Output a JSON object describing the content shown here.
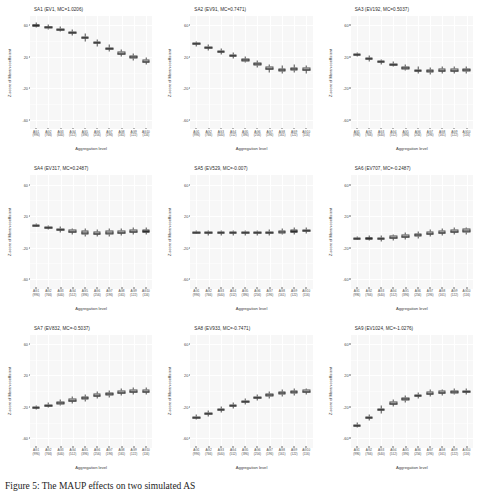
{
  "figure": {
    "caption": "Figure 5: The MAUP effects on two simulated AS",
    "axis_labels": {
      "x": "Aggregation level",
      "y": "Z-score of Moran coefficient"
    },
    "y_ticks": [
      "60",
      "20",
      "-20",
      "-60"
    ],
    "y_tick_values": [
      60,
      20,
      -20,
      -60
    ],
    "ylim": [
      -72,
      72
    ],
    "x_tick_labels": [
      {
        "line1": "AG1",
        "line2": "(996)"
      },
      {
        "line1": "AG2",
        "line2": "(766)"
      },
      {
        "line1": "AG3",
        "line2": "(640)"
      },
      {
        "line1": "AG4",
        "line2": "(512)"
      },
      {
        "line1": "AG5",
        "line2": "(396)"
      },
      {
        "line1": "AG6",
        "line2": "(256)"
      },
      {
        "line1": "AG7",
        "line2": "(196)"
      },
      {
        "line1": "AG8",
        "line2": "(161)"
      },
      {
        "line1": "AG9",
        "line2": "(122)"
      },
      {
        "line1": "AG10",
        "line2": "(116)"
      }
    ]
  },
  "chart_data": [
    {
      "type": "boxplot",
      "title": "SA1 (EV1, MC=1.0206)",
      "xlabel": "Aggregation level",
      "ylabel": "Z-score of Moran coefficient",
      "ylim": [
        -72,
        72
      ],
      "grid": true,
      "categories": [
        "AG1 (996)",
        "AG2 (766)",
        "AG3 (640)",
        "AG4 (512)",
        "AG5 (396)",
        "AG6 (256)",
        "AG7 (196)",
        "AG8 (161)",
        "AG9 (122)",
        "AG10 (116)"
      ],
      "medians": [
        60.0,
        57.5,
        54.5,
        50.0,
        44.0,
        37.5,
        30.0,
        24.0,
        19.5,
        14.0
      ],
      "q1": [
        59.0,
        56.5,
        53.2,
        48.6,
        42.4,
        35.8,
        28.2,
        22.2,
        17.6,
        12.2
      ],
      "q3": [
        61.0,
        58.5,
        55.8,
        51.4,
        45.6,
        39.2,
        31.8,
        25.8,
        21.4,
        15.8
      ],
      "whisker_low": [
        57.0,
        54.5,
        51.0,
        46.0,
        39.5,
        33.0,
        25.5,
        19.5,
        15.0,
        9.5
      ],
      "whisker_high": [
        63.0,
        60.5,
        58.0,
        54.0,
        48.5,
        42.0,
        34.5,
        28.5,
        24.0,
        18.5
      ]
    },
    {
      "type": "boxplot",
      "title": "SA2 (EV91, MC=0.7471)",
      "xlabel": "Aggregation level",
      "ylabel": "Z-score of Moran coefficient",
      "ylim": [
        -72,
        72
      ],
      "grid": true,
      "categories": [
        "AG1 (996)",
        "AG2 (766)",
        "AG3 (640)",
        "AG4 (512)",
        "AG5 (396)",
        "AG6 (256)",
        "AG7 (196)",
        "AG8 (161)",
        "AG9 (122)",
        "AG10 (116)"
      ],
      "medians": [
        36.0,
        31.0,
        26.0,
        21.0,
        15.5,
        10.5,
        5.0,
        3.0,
        4.0,
        3.5
      ],
      "q1": [
        34.8,
        29.8,
        24.8,
        19.6,
        14.0,
        8.8,
        3.0,
        1.0,
        2.0,
        1.5
      ],
      "q3": [
        37.2,
        32.2,
        27.2,
        22.4,
        17.0,
        12.2,
        7.0,
        5.0,
        6.0,
        5.5
      ],
      "whisker_low": [
        32.5,
        27.5,
        22.5,
        17.0,
        11.5,
        6.0,
        0.0,
        -2.0,
        -1.0,
        -1.5
      ],
      "whisker_high": [
        39.5,
        34.5,
        29.5,
        25.0,
        19.5,
        15.0,
        10.0,
        8.0,
        9.0,
        8.5
      ]
    },
    {
      "type": "boxplot",
      "title": "SA3 (EV192, MC=0.5037)",
      "xlabel": "Aggregation level",
      "ylabel": "Z-score of Moran coefficient",
      "ylim": [
        -72,
        72
      ],
      "grid": true,
      "categories": [
        "AG1 (996)",
        "AG2 (766)",
        "AG3 (640)",
        "AG4 (512)",
        "AG5 (396)",
        "AG6 (256)",
        "AG7 (196)",
        "AG8 (161)",
        "AG9 (122)",
        "AG10 (116)"
      ],
      "medians": [
        22.0,
        17.0,
        13.0,
        10.0,
        5.5,
        2.0,
        1.5,
        2.0,
        2.5,
        3.0
      ],
      "q1": [
        21.0,
        15.8,
        11.6,
        8.6,
        3.8,
        0.2,
        -0.5,
        0.0,
        0.5,
        1.0
      ],
      "q3": [
        23.0,
        18.2,
        14.4,
        11.4,
        7.2,
        3.8,
        3.5,
        4.0,
        4.5,
        5.0
      ],
      "whisker_low": [
        19.5,
        13.5,
        9.5,
        6.5,
        1.5,
        -2.5,
        -3.0,
        -2.5,
        -2.0,
        -1.5
      ],
      "whisker_high": [
        24.5,
        20.5,
        16.5,
        13.5,
        9.5,
        6.5,
        6.0,
        6.5,
        7.0,
        7.5
      ]
    },
    {
      "type": "boxplot",
      "title": "SA4 (EV317, MC=0.2487)",
      "xlabel": "Aggregation level",
      "ylabel": "Z-score of Moran coefficient",
      "ylim": [
        -72,
        72
      ],
      "grid": true,
      "categories": [
        "AG1 (996)",
        "AG2 (766)",
        "AG3 (640)",
        "AG4 (512)",
        "AG5 (396)",
        "AG6 (256)",
        "AG7 (196)",
        "AG8 (161)",
        "AG9 (122)",
        "AG10 (116)"
      ],
      "medians": [
        8.0,
        5.0,
        2.5,
        0.0,
        -1.5,
        -2.5,
        -1.5,
        -1.0,
        0.0,
        0.5
      ],
      "q1": [
        7.2,
        3.8,
        1.0,
        -1.8,
        -3.5,
        -4.5,
        -3.5,
        -3.0,
        -2.0,
        -1.5
      ],
      "q3": [
        8.8,
        6.2,
        4.0,
        1.8,
        0.5,
        -0.5,
        0.5,
        1.0,
        2.0,
        2.5
      ],
      "whisker_low": [
        6.0,
        2.0,
        -1.0,
        -4.0,
        -6.0,
        -7.0,
        -6.0,
        -5.5,
        -4.5,
        -4.0
      ],
      "whisker_high": [
        10.0,
        8.0,
        6.0,
        4.0,
        3.0,
        2.0,
        3.0,
        3.5,
        4.5,
        5.0
      ]
    },
    {
      "type": "boxplot",
      "title": "SA5 (EV529, MC=-0.007)",
      "xlabel": "Aggregation level",
      "ylabel": "Z-score of Moran coefficient",
      "ylim": [
        -72,
        72
      ],
      "grid": true,
      "categories": [
        "AG1 (996)",
        "AG2 (766)",
        "AG3 (640)",
        "AG4 (512)",
        "AG5 (396)",
        "AG6 (256)",
        "AG7 (196)",
        "AG8 (161)",
        "AG9 (122)",
        "AG10 (116)"
      ],
      "medians": [
        -1.0,
        -2.0,
        -2.0,
        -2.0,
        -2.0,
        -2.0,
        -1.5,
        -0.5,
        0.5,
        1.0
      ],
      "q1": [
        -1.6,
        -3.4,
        -3.4,
        -3.4,
        -3.4,
        -3.4,
        -3.2,
        -2.2,
        -1.2,
        -0.8
      ],
      "q3": [
        -0.4,
        -0.6,
        -0.6,
        -0.6,
        -0.6,
        -0.6,
        0.2,
        1.2,
        2.2,
        2.8
      ],
      "whisker_low": [
        -2.5,
        -5.5,
        -5.5,
        -5.5,
        -5.5,
        -5.5,
        -5.5,
        -4.5,
        -3.5,
        -3.0
      ],
      "whisker_high": [
        0.5,
        1.5,
        1.5,
        1.5,
        1.5,
        1.5,
        2.5,
        3.5,
        4.5,
        5.0
      ]
    },
    {
      "type": "boxplot",
      "title": "SA6 (EV707, MC=-0.2487)",
      "xlabel": "Aggregation level",
      "ylabel": "Z-score of Moran coefficient",
      "ylim": [
        -72,
        72
      ],
      "grid": true,
      "categories": [
        "AG1 (996)",
        "AG2 (766)",
        "AG3 (640)",
        "AG4 (512)",
        "AG5 (396)",
        "AG6 (256)",
        "AG7 (196)",
        "AG8 (161)",
        "AG9 (122)",
        "AG10 (116)"
      ],
      "medians": [
        -9.0,
        -8.5,
        -9.0,
        -7.5,
        -6.0,
        -4.5,
        -2.5,
        -1.0,
        0.0,
        1.0
      ],
      "q1": [
        -9.8,
        -9.6,
        -10.2,
        -9.2,
        -8.0,
        -6.5,
        -4.5,
        -3.0,
        -2.0,
        -1.0
      ],
      "q3": [
        -8.2,
        -7.4,
        -7.8,
        -5.8,
        -4.0,
        -2.5,
        -0.5,
        1.0,
        2.0,
        3.0
      ],
      "whisker_low": [
        -11.0,
        -11.5,
        -12.5,
        -11.5,
        -10.5,
        -9.0,
        -7.0,
        -5.5,
        -4.5,
        -3.5
      ],
      "whisker_high": [
        -7.0,
        -5.5,
        -5.5,
        -3.5,
        -1.5,
        0.0,
        2.0,
        3.5,
        4.5,
        5.5
      ]
    },
    {
      "type": "boxplot",
      "title": "SA7 (EV832, MC=-0.5037)",
      "xlabel": "Aggregation level",
      "ylabel": "Z-score of Moran coefficient",
      "ylim": [
        -72,
        72
      ],
      "grid": true,
      "categories": [
        "AG1 (996)",
        "AG2 (766)",
        "AG3 (640)",
        "AG4 (512)",
        "AG5 (396)",
        "AG6 (256)",
        "AG7 (196)",
        "AG8 (161)",
        "AG9 (122)",
        "AG10 (116)"
      ],
      "medians": [
        -21.0,
        -18.5,
        -15.5,
        -12.5,
        -9.0,
        -6.0,
        -4.0,
        -2.0,
        -1.0,
        -0.5
      ],
      "q1": [
        -22.0,
        -20.0,
        -17.2,
        -14.4,
        -11.0,
        -8.0,
        -6.0,
        -4.0,
        -3.0,
        -2.5
      ],
      "q3": [
        -20.0,
        -17.0,
        -13.8,
        -10.6,
        -7.0,
        -4.0,
        -2.0,
        0.0,
        1.0,
        1.5
      ],
      "whisker_low": [
        -23.5,
        -22.0,
        -19.5,
        -17.0,
        -13.5,
        -10.5,
        -8.5,
        -6.5,
        -5.5,
        -5.0
      ],
      "whisker_high": [
        -18.5,
        -15.0,
        -11.5,
        -8.0,
        -4.5,
        -1.5,
        0.5,
        2.5,
        3.5,
        4.0
      ]
    },
    {
      "type": "boxplot",
      "title": "SA8 (EV933, MC=-0.7471)",
      "xlabel": "Aggregation level",
      "ylabel": "Z-score of Moran coefficient",
      "ylim": [
        -72,
        72
      ],
      "grid": true,
      "categories": [
        "AG1 (996)",
        "AG2 (766)",
        "AG3 (640)",
        "AG4 (512)",
        "AG5 (396)",
        "AG6 (256)",
        "AG7 (196)",
        "AG8 (161)",
        "AG9 (122)",
        "AG10 (116)"
      ],
      "medians": [
        -34.0,
        -29.0,
        -24.0,
        -19.0,
        -14.0,
        -9.0,
        -5.0,
        -2.5,
        -1.5,
        -1.0
      ],
      "q1": [
        -35.2,
        -30.4,
        -25.6,
        -20.6,
        -15.6,
        -10.6,
        -7.0,
        -4.5,
        -3.5,
        -3.0
      ],
      "q3": [
        -32.8,
        -27.6,
        -22.4,
        -17.4,
        -12.4,
        -7.4,
        -3.0,
        -0.5,
        0.5,
        1.0
      ],
      "whisker_low": [
        -37.0,
        -32.5,
        -28.0,
        -23.0,
        -18.0,
        -13.0,
        -9.5,
        -7.0,
        -6.0,
        -5.5
      ],
      "whisker_high": [
        -31.0,
        -25.5,
        -20.0,
        -15.0,
        -10.0,
        -5.0,
        -1.0,
        1.5,
        2.5,
        3.0
      ]
    },
    {
      "type": "boxplot",
      "title": "SA9 (EV1024, MC=-1.0276)",
      "xlabel": "Aggregation level",
      "ylabel": "Z-score of Moran coefficient",
      "ylim": [
        -72,
        72
      ],
      "grid": true,
      "categories": [
        "AG1 (996)",
        "AG2 (766)",
        "AG3 (640)",
        "AG4 (512)",
        "AG5 (396)",
        "AG6 (256)",
        "AG7 (196)",
        "AG8 (161)",
        "AG9 (122)",
        "AG10 (116)"
      ],
      "medians": [
        -44.0,
        -34.0,
        -24.0,
        -16.0,
        -10.5,
        -6.5,
        -3.0,
        -2.0,
        -1.5,
        -1.0
      ],
      "q1": [
        -45.4,
        -35.6,
        -25.8,
        -17.8,
        -12.2,
        -8.0,
        -4.6,
        -3.6,
        -3.2,
        -2.8
      ],
      "q3": [
        -42.6,
        -32.4,
        -22.2,
        -14.2,
        -8.8,
        -5.0,
        -1.4,
        -0.4,
        0.2,
        0.8
      ],
      "whisker_low": [
        -47.5,
        -38.0,
        -28.5,
        -20.5,
        -15.0,
        -10.5,
        -7.0,
        -6.0,
        -5.5,
        -5.0
      ],
      "whisker_high": [
        -40.5,
        -30.0,
        -19.5,
        -11.5,
        -6.0,
        -2.5,
        1.0,
        2.0,
        2.5,
        3.0
      ]
    }
  ]
}
